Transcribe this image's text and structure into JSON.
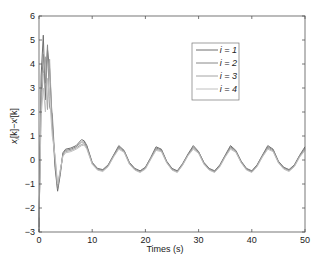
{
  "chart_data": {
    "type": "line",
    "title": "",
    "xlabel": "Times (s)",
    "ylabel": "x_i[k] − x^l[k]",
    "ylabel_parts": {
      "base": "x",
      "sub": "i",
      "mid": "[k]−x",
      "sup": "l",
      "tail": "[k]"
    },
    "xlim": [
      0,
      50
    ],
    "ylim": [
      -3,
      6
    ],
    "xticks": [
      0,
      10,
      20,
      30,
      40,
      50
    ],
    "yticks": [
      -3,
      -2,
      -1,
      0,
      1,
      2,
      3,
      4,
      5,
      6
    ],
    "grid": false,
    "legend_position": "upper right (inset)",
    "legend": [
      "i = 1",
      "i = 2",
      "i = 3",
      "i = 4"
    ],
    "series": [
      {
        "name": "i = 1",
        "color": "#6e6e6e",
        "x": [
          0,
          0.4,
          0.8,
          1.2,
          1.6,
          2.0,
          2.5,
          3.0,
          3.5,
          4.0,
          4.5,
          5.0,
          6.0,
          7.0,
          8.0,
          8.5,
          9.0,
          10.0,
          11.0,
          12.0,
          13.0,
          14.0,
          15.0,
          16.0,
          17.0,
          18.0,
          19.0,
          20.0,
          21.0,
          22.0,
          23.0,
          24.0,
          25.0,
          26.0,
          27.0,
          28.0,
          29.0,
          30.0,
          31.0,
          32.0,
          33.0,
          34.0,
          35.0,
          36.0,
          37.0,
          38.0,
          39.0,
          40.0,
          41.0,
          42.0,
          43.0,
          44.0,
          45.0,
          46.0,
          47.0,
          48.0,
          49.0,
          50.0
        ],
        "values": [
          -3.0,
          3.5,
          5.2,
          2.5,
          4.6,
          3.8,
          1.6,
          -0.3,
          -1.3,
          -0.6,
          0.3,
          0.45,
          0.5,
          0.6,
          0.85,
          0.8,
          0.6,
          -0.1,
          -0.35,
          -0.4,
          -0.2,
          0.2,
          0.6,
          0.4,
          -0.1,
          -0.35,
          -0.45,
          -0.3,
          0.1,
          0.55,
          0.45,
          -0.05,
          -0.35,
          -0.45,
          -0.15,
          0.25,
          0.6,
          0.35,
          -0.1,
          -0.35,
          -0.45,
          -0.2,
          0.2,
          0.6,
          0.4,
          -0.05,
          -0.35,
          -0.45,
          -0.2,
          0.2,
          0.6,
          0.45,
          -0.05,
          -0.3,
          -0.4,
          -0.2,
          0.2,
          0.55
        ]
      },
      {
        "name": "i = 2",
        "color": "#888888",
        "x": [
          0,
          0.4,
          0.8,
          1.2,
          1.6,
          2.0,
          2.5,
          3.0,
          3.5,
          4.0,
          4.5,
          5.0,
          6.0,
          7.0,
          8.0,
          8.5,
          9.0,
          10.0,
          11.0,
          12.0,
          13.0,
          14.0,
          15.0,
          16.0,
          17.0,
          18.0,
          19.0,
          20.0,
          21.0,
          22.0,
          23.0,
          24.0,
          25.0,
          26.0,
          27.0,
          28.0,
          29.0,
          30.0,
          31.0,
          32.0,
          33.0,
          34.0,
          35.0,
          36.0,
          37.0,
          38.0,
          39.0,
          40.0,
          41.0,
          42.0,
          43.0,
          44.0,
          45.0,
          46.0,
          47.0,
          48.0,
          49.0,
          50.0
        ],
        "values": [
          -2.8,
          2.8,
          4.4,
          3.2,
          4.8,
          2.2,
          1.9,
          -0.1,
          -1.2,
          -0.5,
          0.25,
          0.4,
          0.45,
          0.55,
          0.75,
          0.75,
          0.55,
          -0.12,
          -0.38,
          -0.42,
          -0.22,
          0.18,
          0.55,
          0.38,
          -0.12,
          -0.38,
          -0.48,
          -0.32,
          0.08,
          0.5,
          0.42,
          -0.08,
          -0.38,
          -0.48,
          -0.18,
          0.22,
          0.55,
          0.32,
          -0.12,
          -0.38,
          -0.48,
          -0.22,
          0.18,
          0.55,
          0.38,
          -0.08,
          -0.38,
          -0.48,
          -0.22,
          0.18,
          0.55,
          0.42,
          -0.08,
          -0.32,
          -0.42,
          -0.22,
          0.18,
          0.5
        ]
      },
      {
        "name": "i = 3",
        "color": "#a4a4a4",
        "x": [
          0,
          0.4,
          0.8,
          1.2,
          1.6,
          2.0,
          2.5,
          3.0,
          3.5,
          4.0,
          4.5,
          5.0,
          6.0,
          7.0,
          8.0,
          8.5,
          9.0,
          10.0,
          11.0,
          12.0,
          13.0,
          14.0,
          15.0,
          16.0,
          17.0,
          18.0,
          19.0,
          20.0,
          21.0,
          22.0,
          23.0,
          24.0,
          25.0,
          26.0,
          27.0,
          28.0,
          29.0,
          30.0,
          31.0,
          32.0,
          33.0,
          34.0,
          35.0,
          36.0,
          37.0,
          38.0,
          39.0,
          40.0,
          41.0,
          42.0,
          43.0,
          44.0,
          45.0,
          46.0,
          47.0,
          48.0,
          49.0,
          50.0
        ],
        "values": [
          -2.6,
          2.2,
          3.6,
          4.3,
          2.1,
          4.2,
          1.3,
          0.1,
          -1.1,
          -0.45,
          0.2,
          0.35,
          0.4,
          0.5,
          0.65,
          0.68,
          0.5,
          -0.15,
          -0.4,
          -0.45,
          -0.25,
          0.15,
          0.5,
          0.35,
          -0.15,
          -0.4,
          -0.5,
          -0.35,
          0.05,
          0.45,
          0.38,
          -0.1,
          -0.4,
          -0.5,
          -0.2,
          0.2,
          0.5,
          0.3,
          -0.15,
          -0.4,
          -0.5,
          -0.25,
          0.15,
          0.5,
          0.35,
          -0.1,
          -0.4,
          -0.5,
          -0.25,
          0.15,
          0.5,
          0.38,
          -0.1,
          -0.35,
          -0.45,
          -0.25,
          0.15,
          0.45
        ]
      },
      {
        "name": "i = 4",
        "color": "#c0c0c0",
        "x": [
          0,
          0.4,
          0.8,
          1.2,
          1.6,
          2.0,
          2.5,
          3.0,
          3.5,
          4.0,
          4.5,
          5.0,
          6.0,
          7.0,
          8.0,
          8.5,
          9.0,
          10.0,
          11.0,
          12.0,
          13.0,
          14.0,
          15.0,
          16.0,
          17.0,
          18.0,
          19.0,
          20.0,
          21.0,
          22.0,
          23.0,
          24.0,
          25.0,
          26.0,
          27.0,
          28.0,
          29.0,
          30.0,
          31.0,
          32.0,
          33.0,
          34.0,
          35.0,
          36.0,
          37.0,
          38.0,
          39.0,
          40.0,
          41.0,
          42.0,
          43.0,
          44.0,
          45.0,
          46.0,
          47.0,
          48.0,
          49.0,
          50.0
        ],
        "values": [
          -2.4,
          1.8,
          3.0,
          2.0,
          3.4,
          2.6,
          1.0,
          0.2,
          -1.0,
          -0.4,
          0.15,
          0.3,
          0.35,
          0.45,
          0.6,
          0.62,
          0.45,
          -0.18,
          -0.42,
          -0.48,
          -0.28,
          0.12,
          0.45,
          0.32,
          -0.18,
          -0.42,
          -0.52,
          -0.38,
          0.02,
          0.4,
          0.35,
          -0.12,
          -0.42,
          -0.52,
          -0.22,
          0.18,
          0.45,
          0.28,
          -0.18,
          -0.42,
          -0.52,
          -0.28,
          0.12,
          0.45,
          0.32,
          -0.12,
          -0.42,
          -0.52,
          -0.28,
          0.12,
          0.45,
          0.35,
          -0.12,
          -0.38,
          -0.48,
          -0.28,
          0.12,
          0.4
        ]
      }
    ]
  }
}
